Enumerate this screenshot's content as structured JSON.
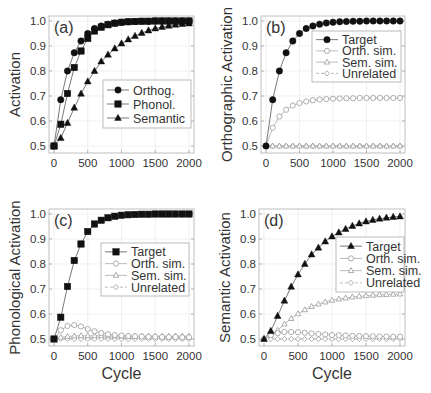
{
  "figure": {
    "width": 431,
    "height": 393
  },
  "chart_data": [
    {
      "type": "line",
      "panel_label": "(a)",
      "title": "",
      "xlabel": "",
      "ylabel": "Activation",
      "xlim": [
        0,
        2000
      ],
      "ylim": [
        0.5,
        1.0
      ],
      "xticks": [
        0,
        500,
        1000,
        1500,
        2000
      ],
      "yticks": [
        0.5,
        0.6,
        0.7,
        0.8,
        0.9,
        1.0
      ],
      "ytick_labels": [
        "0.5",
        "0.6",
        "0.7",
        "0.8",
        "0.9",
        "1.0"
      ],
      "grid": true,
      "legend_position": "center-right",
      "box": {
        "x": 49,
        "y": 16,
        "w": 145,
        "h": 137
      },
      "legend": {
        "x": 103,
        "y": 80,
        "w": 88,
        "h": 48
      },
      "x": [
        0,
        100,
        200,
        300,
        400,
        500,
        600,
        700,
        800,
        900,
        1000,
        1100,
        1200,
        1300,
        1400,
        1500,
        1600,
        1700,
        1800,
        1900,
        2000
      ],
      "series": [
        {
          "name": "Orthog.",
          "marker": "circle",
          "fill": "#111111",
          "line": "#555555",
          "dash": "",
          "values": [
            0.5,
            0.685,
            0.8,
            0.873,
            0.92,
            0.95,
            0.97,
            0.98,
            0.987,
            0.992,
            0.995,
            0.997,
            0.998,
            0.999,
            0.999,
            1.0,
            1.0,
            1.0,
            1.0,
            1.0,
            1.0
          ]
        },
        {
          "name": "Phonol.",
          "marker": "square",
          "fill": "#111111",
          "line": "#555555",
          "dash": "",
          "values": [
            0.5,
            0.587,
            0.71,
            0.814,
            0.88,
            0.93,
            0.96,
            0.975,
            0.985,
            0.991,
            0.995,
            0.997,
            0.998,
            0.999,
            0.999,
            1.0,
            1.0,
            1.0,
            1.0,
            1.0,
            1.0
          ]
        },
        {
          "name": "Semantic",
          "marker": "triangle",
          "fill": "#111111",
          "line": "#555555",
          "dash": "",
          "values": [
            0.5,
            0.532,
            0.592,
            0.653,
            0.709,
            0.758,
            0.8,
            0.838,
            0.865,
            0.89,
            0.91,
            0.926,
            0.94,
            0.952,
            0.962,
            0.97,
            0.976,
            0.981,
            0.985,
            0.988,
            0.99
          ]
        }
      ]
    },
    {
      "type": "line",
      "panel_label": "(b)",
      "title": "",
      "xlabel": "",
      "ylabel": "Orthographic Activation",
      "xlim": [
        0,
        2000
      ],
      "ylim": [
        0.5,
        1.0
      ],
      "xticks": [
        0,
        500,
        1000,
        1500,
        2000
      ],
      "yticks": [
        0.5,
        0.6,
        0.7,
        0.8,
        0.9,
        1.0
      ],
      "ytick_labels": [
        "0.5",
        "0.6",
        "0.7",
        "0.8",
        "0.9",
        "1.0"
      ],
      "grid": true,
      "legend_position": "upper-right",
      "box": {
        "x": 261,
        "y": 16,
        "w": 144,
        "h": 137
      },
      "legend": {
        "x": 312,
        "y": 31,
        "w": 89,
        "h": 51
      },
      "x": [
        0,
        100,
        200,
        300,
        400,
        500,
        600,
        700,
        800,
        900,
        1000,
        1100,
        1200,
        1300,
        1400,
        1500,
        1600,
        1700,
        1800,
        1900,
        2000
      ],
      "series": [
        {
          "name": "Target",
          "marker": "circle",
          "fill": "#111111",
          "line": "#555555",
          "dash": "",
          "values": [
            0.5,
            0.685,
            0.8,
            0.873,
            0.92,
            0.95,
            0.97,
            0.98,
            0.987,
            0.992,
            0.995,
            0.997,
            0.998,
            0.999,
            0.999,
            1.0,
            1.0,
            1.0,
            1.0,
            1.0,
            1.0
          ]
        },
        {
          "name": "Orth. sim.",
          "marker": "circle",
          "fill": "#ffffff",
          "line": "#aaaaaa",
          "dash": "",
          "values": [
            0.5,
            0.573,
            0.618,
            0.645,
            0.662,
            0.672,
            0.678,
            0.683,
            0.686,
            0.688,
            0.689,
            0.69,
            0.691,
            0.691,
            0.692,
            0.692,
            0.692,
            0.692,
            0.692,
            0.692,
            0.692
          ]
        },
        {
          "name": "Sem. sim.",
          "marker": "triangle",
          "fill": "#ffffff",
          "line": "#aaaaaa",
          "dash": "",
          "values": [
            0.5,
            0.5,
            0.5,
            0.5,
            0.5,
            0.5,
            0.5,
            0.5,
            0.5,
            0.5,
            0.5,
            0.5,
            0.5,
            0.5,
            0.5,
            0.5,
            0.5,
            0.5,
            0.5,
            0.5,
            0.5
          ]
        },
        {
          "name": "Unrelated",
          "marker": "diamond",
          "fill": "#ffffff",
          "line": "#aaaaaa",
          "dash": "3,2",
          "values": [
            0.5,
            0.5,
            0.5,
            0.5,
            0.5,
            0.5,
            0.5,
            0.5,
            0.5,
            0.5,
            0.5,
            0.5,
            0.5,
            0.5,
            0.5,
            0.5,
            0.5,
            0.5,
            0.5,
            0.5,
            0.5
          ]
        }
      ]
    },
    {
      "type": "line",
      "panel_label": "(c)",
      "title": "",
      "xlabel": "Cycle",
      "ylabel": "Phonological Activation",
      "xlim": [
        0,
        2000
      ],
      "ylim": [
        0.5,
        1.0
      ],
      "xticks": [
        0,
        500,
        1000,
        1500,
        2000
      ],
      "yticks": [
        0.5,
        0.6,
        0.7,
        0.8,
        0.9,
        1.0
      ],
      "ytick_labels": [
        "0.5",
        "0.6",
        "0.7",
        "0.8",
        "0.9",
        "1.0"
      ],
      "grid": true,
      "legend_position": "center-right",
      "box": {
        "x": 49,
        "y": 209,
        "w": 145,
        "h": 137
      },
      "legend": {
        "x": 101,
        "y": 243,
        "w": 88,
        "h": 53
      },
      "x": [
        0,
        100,
        200,
        300,
        400,
        500,
        600,
        700,
        800,
        900,
        1000,
        1100,
        1200,
        1300,
        1400,
        1500,
        1600,
        1700,
        1800,
        1900,
        2000
      ],
      "series": [
        {
          "name": "Target",
          "marker": "square",
          "fill": "#111111",
          "line": "#555555",
          "dash": "",
          "values": [
            0.5,
            0.587,
            0.71,
            0.814,
            0.88,
            0.93,
            0.96,
            0.975,
            0.985,
            0.991,
            0.995,
            0.997,
            0.998,
            0.999,
            0.999,
            1.0,
            1.0,
            1.0,
            1.0,
            1.0,
            1.0
          ]
        },
        {
          "name": "Orth. sim.",
          "marker": "circle",
          "fill": "#ffffff",
          "line": "#aaaaaa",
          "dash": "",
          "values": [
            0.5,
            0.535,
            0.552,
            0.556,
            0.55,
            0.54,
            0.531,
            0.524,
            0.519,
            0.516,
            0.514,
            0.512,
            0.511,
            0.51,
            0.509,
            0.509,
            0.508,
            0.508,
            0.508,
            0.507,
            0.507
          ]
        },
        {
          "name": "Sem. sim.",
          "marker": "triangle",
          "fill": "#ffffff",
          "line": "#aaaaaa",
          "dash": "",
          "values": [
            0.5,
            0.507,
            0.51,
            0.512,
            0.513,
            0.513,
            0.513,
            0.513,
            0.512,
            0.512,
            0.512,
            0.511,
            0.511,
            0.511,
            0.511,
            0.511,
            0.511,
            0.511,
            0.511,
            0.511,
            0.511
          ]
        },
        {
          "name": "Unrelated",
          "marker": "diamond",
          "fill": "#ffffff",
          "line": "#aaaaaa",
          "dash": "3,2",
          "values": [
            0.5,
            0.5,
            0.5,
            0.5,
            0.5,
            0.5,
            0.5,
            0.5,
            0.5,
            0.5,
            0.5,
            0.5,
            0.5,
            0.5,
            0.5,
            0.5,
            0.5,
            0.5,
            0.5,
            0.5,
            0.5
          ]
        }
      ]
    },
    {
      "type": "line",
      "panel_label": "(d)",
      "title": "",
      "xlabel": "Cycle",
      "ylabel": "Semantic Activation",
      "xlim": [
        0,
        2000
      ],
      "ylim": [
        0.5,
        1.0
      ],
      "xticks": [
        0,
        500,
        1000,
        1500,
        2000
      ],
      "yticks": [
        0.5,
        0.6,
        0.7,
        0.8,
        0.9,
        1.0
      ],
      "ytick_labels": [
        "0.5",
        "0.6",
        "0.7",
        "0.8",
        "0.9",
        "1.0"
      ],
      "grid": true,
      "legend_position": "center-right",
      "box": {
        "x": 259,
        "y": 209,
        "w": 146,
        "h": 137
      },
      "legend": {
        "x": 336,
        "y": 237,
        "w": 68,
        "h": 55
      },
      "x": [
        0,
        100,
        200,
        300,
        400,
        500,
        600,
        700,
        800,
        900,
        1000,
        1100,
        1200,
        1300,
        1400,
        1500,
        1600,
        1700,
        1800,
        1900,
        2000
      ],
      "series": [
        {
          "name": "Target",
          "marker": "triangle",
          "fill": "#111111",
          "line": "#555555",
          "dash": "",
          "values": [
            0.5,
            0.532,
            0.592,
            0.653,
            0.709,
            0.758,
            0.8,
            0.838,
            0.865,
            0.89,
            0.91,
            0.926,
            0.94,
            0.952,
            0.962,
            0.97,
            0.976,
            0.981,
            0.985,
            0.988,
            0.99
          ]
        },
        {
          "name": "Orth. sim.",
          "marker": "circle",
          "fill": "#ffffff",
          "line": "#aaaaaa",
          "dash": "",
          "values": [
            0.5,
            0.515,
            0.523,
            0.528,
            0.528,
            0.527,
            0.525,
            0.522,
            0.52,
            0.518,
            0.516,
            0.515,
            0.514,
            0.513,
            0.512,
            0.511,
            0.511,
            0.51,
            0.51,
            0.509,
            0.509
          ]
        },
        {
          "name": "Sem. sim.",
          "marker": "triangle",
          "fill": "#ffffff",
          "line": "#aaaaaa",
          "dash": "",
          "values": [
            0.5,
            0.515,
            0.535,
            0.56,
            0.582,
            0.601,
            0.617,
            0.63,
            0.64,
            0.648,
            0.655,
            0.66,
            0.664,
            0.668,
            0.671,
            0.673,
            0.675,
            0.677,
            0.678,
            0.679,
            0.68
          ]
        },
        {
          "name": "Unrelated",
          "marker": "diamond",
          "fill": "#ffffff",
          "line": "#aaaaaa",
          "dash": "3,2",
          "values": [
            0.5,
            0.5,
            0.5,
            0.5,
            0.5,
            0.5,
            0.5,
            0.5,
            0.5,
            0.5,
            0.5,
            0.5,
            0.5,
            0.5,
            0.5,
            0.5,
            0.5,
            0.5,
            0.5,
            0.5,
            0.5
          ]
        }
      ]
    }
  ]
}
